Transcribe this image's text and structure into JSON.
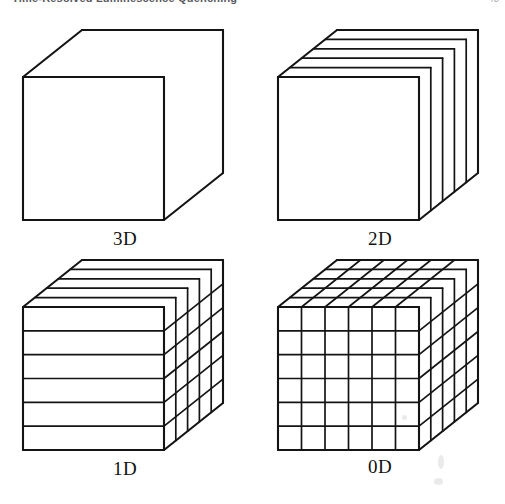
{
  "header": {
    "title": "Time-Resolved Luminescence Quenching",
    "page_number": "43"
  },
  "figure": {
    "panels": [
      {
        "id": "3d",
        "label": "3D",
        "description": "bulk cube, no confinement",
        "front_divisions_x": 1,
        "front_divisions_y": 1,
        "depth_divisions": 1
      },
      {
        "id": "2d",
        "label": "2D",
        "description": "quantum wells - cube sliced into vertical slabs along the depth axis",
        "front_divisions_x": 1,
        "front_divisions_y": 1,
        "depth_divisions": 5
      },
      {
        "id": "1d",
        "label": "1D",
        "description": "quantum wires - cube sliced into rods",
        "front_divisions_x": 1,
        "front_divisions_y": 6,
        "depth_divisions": 5
      },
      {
        "id": "0d",
        "label": "0D",
        "description": "quantum dots - cube sliced into small cubes",
        "front_divisions_x": 6,
        "front_divisions_y": 6,
        "depth_divisions": 5
      }
    ],
    "geometry": {
      "front_width": 141,
      "front_height": 143,
      "depth_dx": 59,
      "depth_dy": -47,
      "stroke_color": "#141414",
      "fill_color": "#ffffff",
      "outer_stroke_width": 2.1,
      "inner_stroke_width": 1.7
    }
  }
}
